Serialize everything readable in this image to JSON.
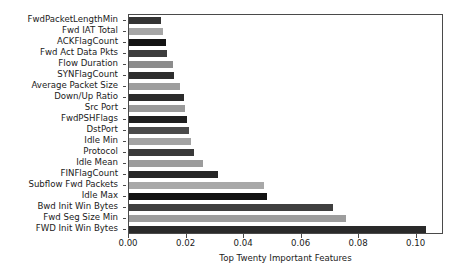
{
  "chart_data": {
    "type": "bar",
    "orientation": "horizontal",
    "title": "",
    "xlabel": "Top Twenty Important Features",
    "ylabel": "",
    "xlim": [
      0.0,
      0.1095
    ],
    "grid": false,
    "legend": null,
    "xticks": [
      "0.00",
      "0.02",
      "0.04",
      "0.06",
      "0.08",
      "0.10"
    ],
    "xtick_values": [
      0.0,
      0.02,
      0.04,
      0.06,
      0.08,
      0.1
    ],
    "categories": [
      "FwdPacketLengthMin",
      "Fwd IAT Total",
      "ACKFlagCount",
      "Fwd Act Data Pkts",
      "Flow  Duration",
      "SYNFlagCount",
      "Average Packet Size",
      "Down/Up Ratio",
      "Src  Port",
      "FwdPSHFlags",
      "DstPort",
      "Idle Min",
      "Protocol",
      "Idle Mean",
      "FINFlagCount",
      "Subflow Fwd Packets",
      "Idle Max",
      "Bwd Init Win Bytes",
      "Fwd Seg Size Min",
      "FWD Init Win Bytes"
    ],
    "values": [
      0.0112,
      0.0118,
      0.0128,
      0.0133,
      0.0152,
      0.0158,
      0.0176,
      0.0191,
      0.0196,
      0.02,
      0.0207,
      0.0216,
      0.0226,
      0.0256,
      0.0311,
      0.047,
      0.0478,
      0.071,
      0.0755,
      0.1033
    ],
    "colors": [
      "#333333",
      "#a6a6a6",
      "#141414",
      "#3d3d3d",
      "#8c8c8c",
      "#2e2e2e",
      "#9e9e9e",
      "#2b2b2b",
      "#9a9a9a",
      "#1f1f1f",
      "#4a4a4a",
      "#a3a3a3",
      "#3a3a3a",
      "#9c9c9c",
      "#262626",
      "#a8a8a8",
      "#121212",
      "#3f3f3f",
      "#9d9d9d",
      "#2a2a2a"
    ],
    "axis_color": "#4a4a4a",
    "background_color": "#ffffff"
  }
}
